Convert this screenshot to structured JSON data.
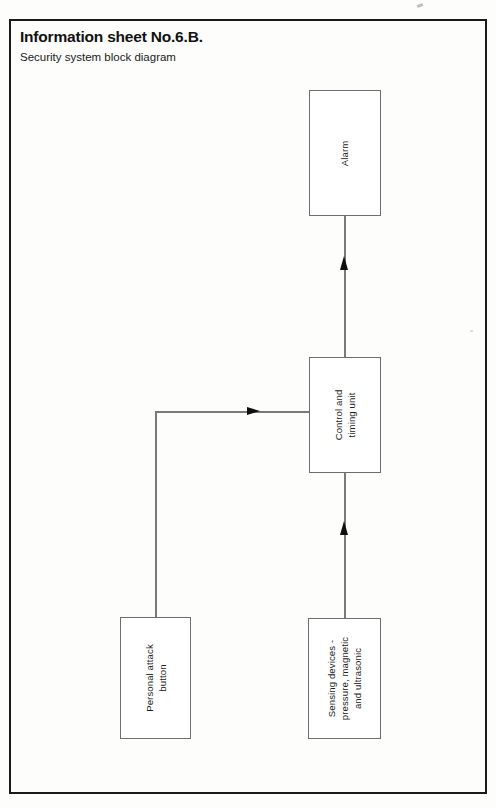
{
  "sheet": {
    "title": "Information sheet No.6.B.",
    "subtitle": "Security system block diagram"
  },
  "diagram": {
    "type": "block-diagram",
    "blocks": [
      {
        "id": "alarm",
        "label": "Alarm",
        "lines": [
          "Alarm"
        ]
      },
      {
        "id": "control",
        "label": "Control and timing unit",
        "lines": [
          "Control and",
          "timing unit"
        ]
      },
      {
        "id": "sensing",
        "label": "Sensing devices - pressure, magnetic and ultrasonic",
        "lines": [
          "Sensing devices -",
          "pressure, magnetic",
          "and ultrasonic"
        ]
      },
      {
        "id": "attack",
        "label": "Personal attack button",
        "lines": [
          "Personal attack",
          "button"
        ]
      }
    ],
    "connections": [
      {
        "from": "control",
        "to": "alarm",
        "direction": "up"
      },
      {
        "from": "sensing",
        "to": "control",
        "direction": "up"
      },
      {
        "from": "attack",
        "to": "control",
        "direction": "right"
      }
    ]
  },
  "colors": {
    "frame": "#1a1a1a",
    "block_border": "#6e6e6e",
    "connector": "#7a7a7a",
    "arrowhead": "#101010",
    "text": "#1c1c1c",
    "background": "#fdfdfc"
  }
}
